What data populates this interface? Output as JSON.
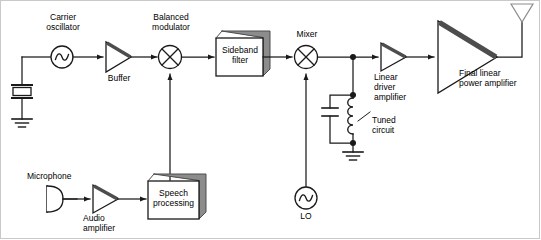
{
  "diagram": {
    "type": "block-diagram-circuit",
    "labels": {
      "carrier_oscillator": "Carrier\noscillator",
      "buffer": "Buffer",
      "balanced_modulator": "Balanced\nmodulator",
      "sideband_filter": "Sideband\nfilter",
      "mixer": "Mixer",
      "linear_driver_amplifier": "Linear\ndriver\namplifier",
      "final_linear_power_amplifier": "Final linear\npower amplifier",
      "tuned_circuit": "Tuned\ncircuit",
      "lo": "LO",
      "microphone": "Microphone",
      "audio_amplifier": "Audio\namplifier",
      "speech_processing": "Speech\nprocessing"
    },
    "blocks": [
      {
        "name": "crystal",
        "kind": "crystal-symbol"
      },
      {
        "name": "ground-crystal",
        "kind": "ground-symbol"
      },
      {
        "name": "carrier-oscillator",
        "kind": "oscillator-circle"
      },
      {
        "name": "buffer-amplifier",
        "kind": "triangle-amplifier"
      },
      {
        "name": "balanced-modulator",
        "kind": "mixer-circle-x"
      },
      {
        "name": "sideband-filter",
        "kind": "3d-box"
      },
      {
        "name": "mixer",
        "kind": "mixer-circle-x"
      },
      {
        "name": "capacitor",
        "kind": "capacitor-symbol"
      },
      {
        "name": "inductor",
        "kind": "inductor-coil"
      },
      {
        "name": "ground-tuned-circuit",
        "kind": "ground-symbol"
      },
      {
        "name": "linear-driver-amplifier",
        "kind": "triangle-amplifier"
      },
      {
        "name": "final-linear-power-amplifier",
        "kind": "triangle-amplifier"
      },
      {
        "name": "antenna",
        "kind": "antenna-triangle"
      },
      {
        "name": "lo-oscillator",
        "kind": "oscillator-circle"
      },
      {
        "name": "microphone",
        "kind": "microphone-symbol"
      },
      {
        "name": "audio-amplifier",
        "kind": "triangle-amplifier"
      },
      {
        "name": "speech-processing",
        "kind": "3d-box"
      }
    ],
    "colors": {
      "line": "#1a1a1a",
      "shadow": "#808080",
      "box_fill": "#ffffff",
      "accent_bar": "#4d4d4d",
      "background": "#ffffff",
      "frame": "#c9c9c9"
    }
  }
}
